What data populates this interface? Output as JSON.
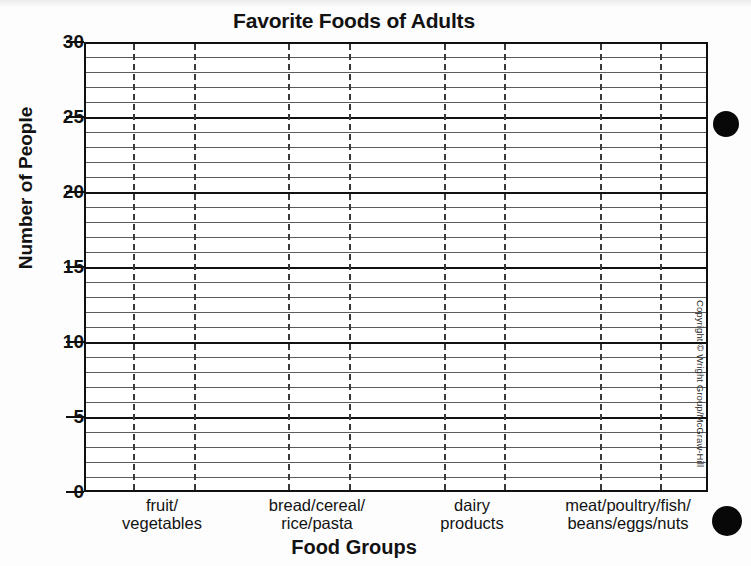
{
  "chart_data": {
    "type": "bar",
    "title": "Favorite Foods of Adults",
    "xlabel": "Food Groups",
    "ylabel": "Number of People",
    "categories": [
      "fruit/ vegetables",
      "bread/cereal/ rice/pasta",
      "dairy products",
      "meat/poultry/fish/ beans/eggs/nuts"
    ],
    "category_lines": [
      [
        "fruit/",
        "vegetables"
      ],
      [
        "bread/cereal/",
        "rice/pasta"
      ],
      [
        "dairy",
        "products"
      ],
      [
        "meat/poultry/fish/",
        "beans/eggs/nuts"
      ]
    ],
    "values": [
      null,
      null,
      null,
      null
    ],
    "ylim": [
      0,
      30
    ],
    "y_major_ticks": [
      0,
      5,
      10,
      15,
      20,
      25,
      30
    ],
    "y_minor_step": 1,
    "grid": "horizontal gridlines every 1 unit, bold at every 5; dashed vertical gridlines bounding each category column",
    "legend": "none",
    "note": "Blank worksheet grid — no bars are plotted; axes and gridlines only."
  },
  "page": {
    "copyright": "Copyright © Wright Group/McGraw-Hill"
  },
  "marks": {
    "top_dot": "filled-circle",
    "bottom_dot": "filled-circle"
  }
}
